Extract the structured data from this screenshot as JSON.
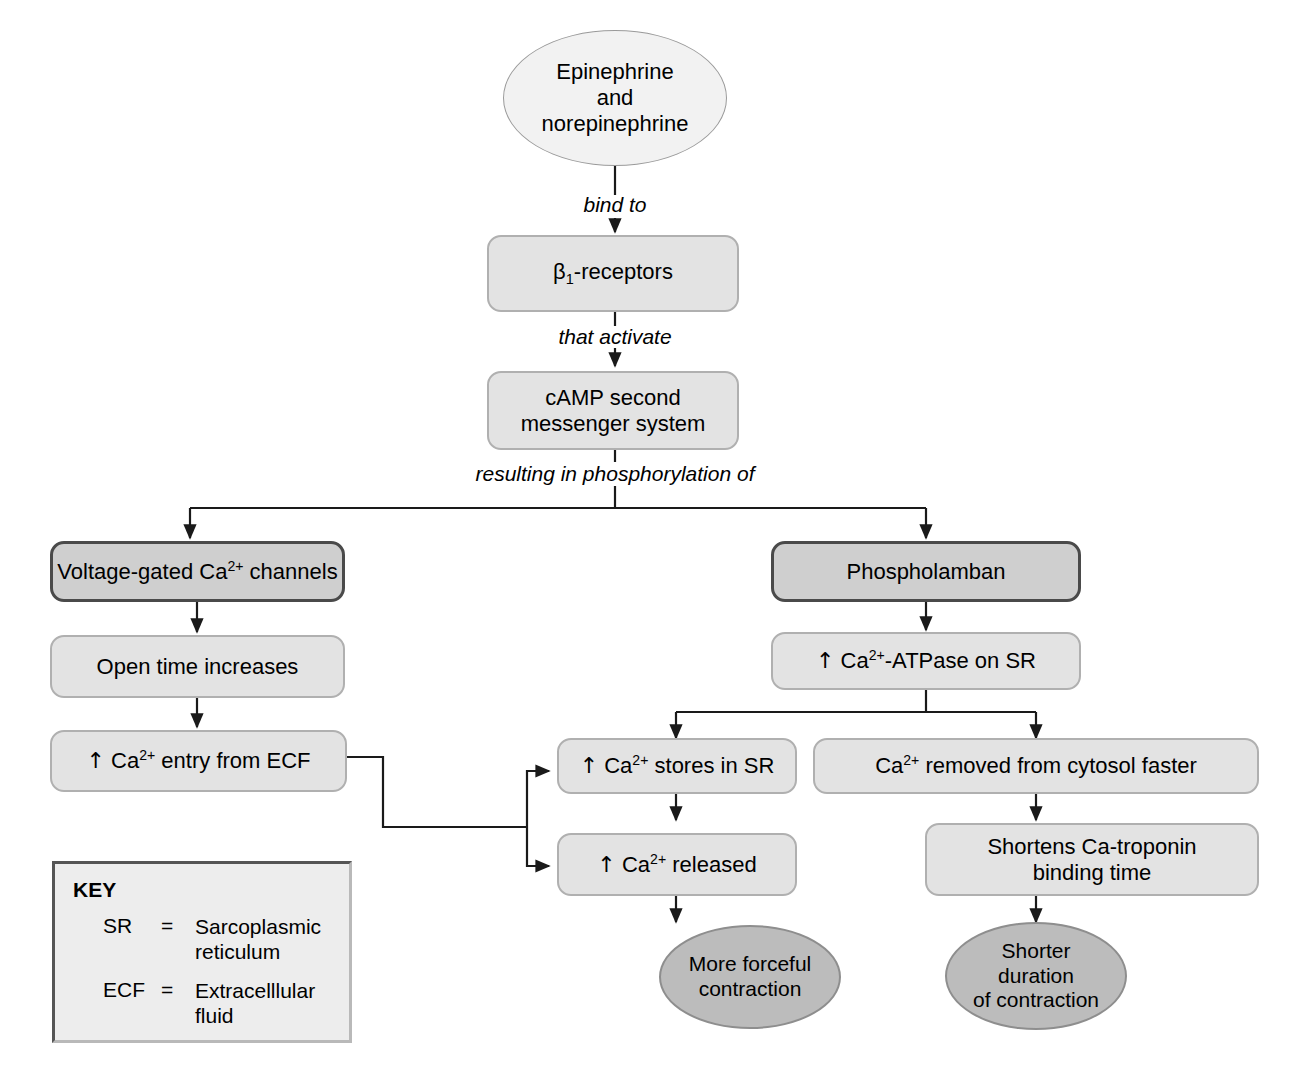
{
  "diagram": {
    "colors": {
      "page_background": "#ffffff",
      "light_node_fill": "#f2f2f2",
      "box_fill": "#e3e3e3",
      "emphasis_box_fill": "#cfcfcf",
      "emphasis_border": "#4a4a4a",
      "outcome_ellipse_fill": "#bcbcbc",
      "wire": "#1a1a1a",
      "key_fill": "#ededed",
      "key_border": "#555555"
    }
  },
  "nodes": {
    "stimulus": {
      "label": "Epinephrine\nand\nnorepinephrine",
      "shape": "ellipse"
    },
    "receptors": {
      "label": "β1-receptors",
      "shape": "rounded-box"
    },
    "camp": {
      "label": "cAMP second\nmessenger system",
      "shape": "rounded-box"
    },
    "calcium_channels": {
      "label": "Voltage-gated Ca2+ channels",
      "shape": "rounded-box-emphasis"
    },
    "open_time": {
      "label": "Open time increases",
      "shape": "rounded-box"
    },
    "ca_entry": {
      "label": "↑ Ca2+ entry from ECF",
      "shape": "rounded-box"
    },
    "phospholamban": {
      "label": "Phospholamban",
      "shape": "rounded-box-emphasis"
    },
    "atpase": {
      "label": "↑ Ca2+-ATPase on SR",
      "shape": "rounded-box"
    },
    "ca_stores": {
      "label": "↑ Ca2+ stores in SR",
      "shape": "rounded-box"
    },
    "ca_released": {
      "label": "↑ Ca2+ released",
      "shape": "rounded-box"
    },
    "ca_removed": {
      "label": "Ca2+ removed from cytosol faster",
      "shape": "rounded-box"
    },
    "shortens_troponin": {
      "label": "Shortens Ca-troponin\nbinding time",
      "shape": "rounded-box"
    },
    "more_forceful": {
      "label": "More forceful\ncontraction",
      "shape": "ellipse-outcome"
    },
    "shorter_duration": {
      "label": "Shorter\nduration\nof contraction",
      "shape": "ellipse-outcome"
    }
  },
  "edge_labels": {
    "bind_to": "bind to",
    "that_activate": "that activate",
    "resulting_in": "resulting in phosphorylation of"
  },
  "key": {
    "title": "KEY",
    "entries": [
      {
        "abbr": "SR",
        "eq": "=",
        "definition": "Sarcoplasmic\nreticulum"
      },
      {
        "abbr": "ECF",
        "eq": "=",
        "definition": "Extracelllular\nfluid"
      }
    ]
  }
}
